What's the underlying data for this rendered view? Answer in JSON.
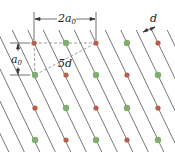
{
  "diagram": {
    "labels": {
      "width_label": "2a",
      "width_sub": "0",
      "height_label": "a",
      "height_sub": "0",
      "diag_label": "5d",
      "spacing_label": "d"
    },
    "colors": {
      "red_atom": "#b5614a",
      "green_atom": "#7fae6e",
      "line": "#555555",
      "dash": "#777777"
    },
    "atoms": [
      {
        "x": 34,
        "y": 43,
        "c": "red"
      },
      {
        "x": 66,
        "y": 43,
        "c": "green"
      },
      {
        "x": 96,
        "y": 43,
        "c": "red"
      },
      {
        "x": 127,
        "y": 43,
        "c": "green"
      },
      {
        "x": 158,
        "y": 43,
        "c": "red"
      },
      {
        "x": 35,
        "y": 75,
        "c": "green"
      },
      {
        "x": 66,
        "y": 75,
        "c": "red"
      },
      {
        "x": 96,
        "y": 75,
        "c": "green"
      },
      {
        "x": 127,
        "y": 75,
        "c": "red"
      },
      {
        "x": 158,
        "y": 75,
        "c": "green"
      },
      {
        "x": 35,
        "y": 108,
        "c": "red"
      },
      {
        "x": 66,
        "y": 108,
        "c": "green"
      },
      {
        "x": 96,
        "y": 108,
        "c": "red"
      },
      {
        "x": 127,
        "y": 108,
        "c": "green"
      },
      {
        "x": 158,
        "y": 108,
        "c": "red"
      },
      {
        "x": 35,
        "y": 140,
        "c": "green"
      },
      {
        "x": 66,
        "y": 140,
        "c": "red"
      },
      {
        "x": 96,
        "y": 140,
        "c": "green"
      },
      {
        "x": 127,
        "y": 140,
        "c": "red"
      },
      {
        "x": 158,
        "y": 140,
        "c": "green"
      }
    ]
  }
}
